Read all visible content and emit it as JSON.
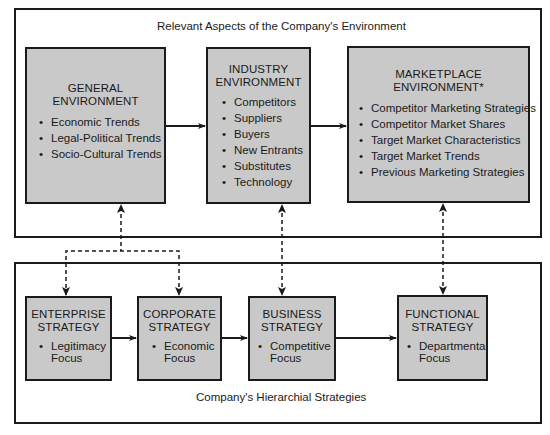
{
  "environment": {
    "caption": "Relevant Aspects of the Company's Environment",
    "general": {
      "title_line1": "GENERAL",
      "title_line2": "ENVIRONMENT",
      "items": [
        "Economic Trends",
        "Legal-Political Trends",
        "Socio-Cultural Trends"
      ]
    },
    "industry": {
      "title_line1": "INDUSTRY",
      "title_line2": "ENVIRONMENT",
      "items": [
        "Competitors",
        "Suppliers",
        "Buyers",
        "New Entrants",
        "Substitutes",
        "Technology"
      ]
    },
    "marketplace": {
      "title_line1": "MARKETPLACE",
      "title_line2": "ENVIRONMENT*",
      "items": [
        "Competitor Marketing Strategies",
        "Competitor Market Shares",
        "Target Market Characteristics",
        "Target Market Trends",
        "Previous Marketing Strategies"
      ]
    }
  },
  "strategies": {
    "caption": "Company's Hierarchial Strategies",
    "enterprise": {
      "title_line1": "ENTERPRISE",
      "title_line2": "STRATEGY",
      "item_line1": "Legitimacy",
      "item_line2": "Focus"
    },
    "corporate": {
      "title_line1": "CORPORATE",
      "title_line2": "STRATEGY",
      "item_line1": "Economic",
      "item_line2": "Focus"
    },
    "business": {
      "title_line1": "BUSINESS",
      "title_line2": "STRATEGY",
      "item_line1": "Competitive",
      "item_line2": "Focus"
    },
    "functional": {
      "title_line1": "FUNCTIONAL",
      "title_line2": "STRATEGY",
      "item_line1": "Departmental",
      "item_line2": "Focus"
    }
  },
  "colors": {
    "box_fill": "#c9c9c9",
    "line": "#1a1a1a",
    "background": "#ffffff"
  }
}
